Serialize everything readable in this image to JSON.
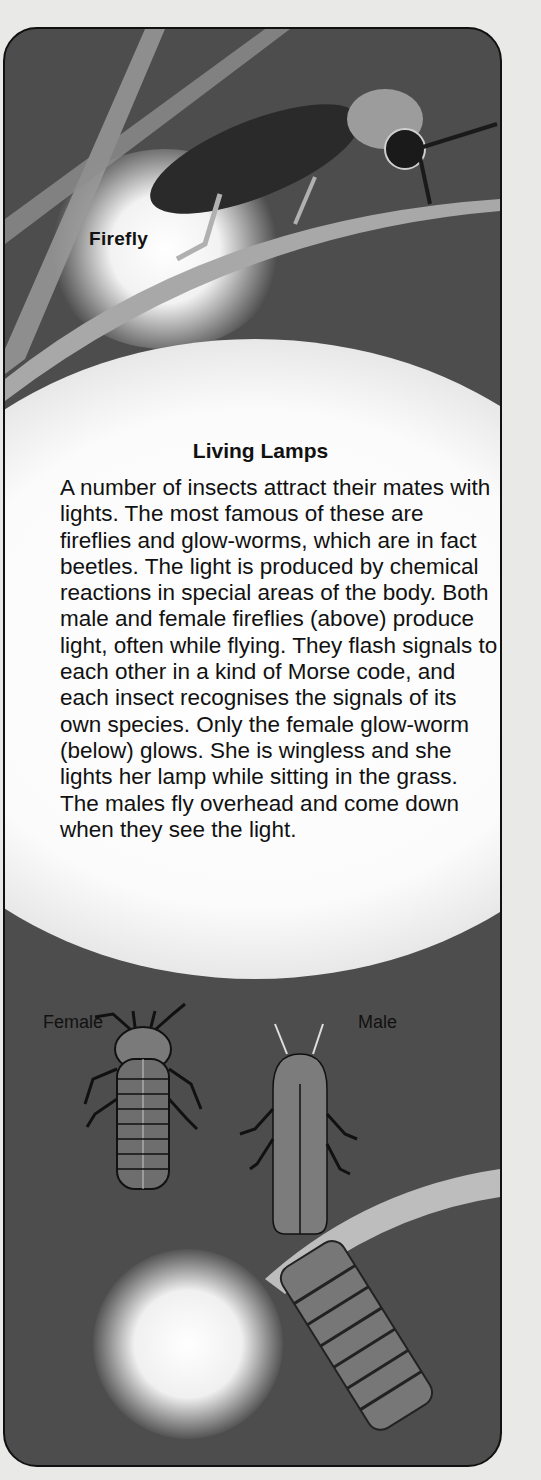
{
  "labels": {
    "firefly": "Firefly",
    "female": "Female",
    "male": "Male"
  },
  "article": {
    "title": "Living Lamps",
    "body": "A number of insects attract their mates with lights. The most famous of these are fireflies and glow-worms, which are in fact beetles. The light is produced by chemical reactions in special areas of the body. Both male and female fireflies (above) produce light, often while flying. They flash signals to each other in a kind of Morse code, and each insect recognises the signals of its own species. Only the female glow-worm (below) glows. She is wingless and she lights her lamp while sitting in the grass. The males fly overhead and come down when they see the light."
  },
  "illustrations": [
    {
      "name": "firefly-on-grass",
      "caption_key": "firefly"
    },
    {
      "name": "female-glow-worm",
      "caption_key": "female"
    },
    {
      "name": "male-glow-worm",
      "caption_key": "male"
    },
    {
      "name": "glowing-female-on-grass"
    }
  ],
  "colors": {
    "page_background": "#e9e9e7",
    "panel_background": "#4d4d4d",
    "border": "#111111",
    "glow": "#ffffff",
    "text": "#111111"
  }
}
